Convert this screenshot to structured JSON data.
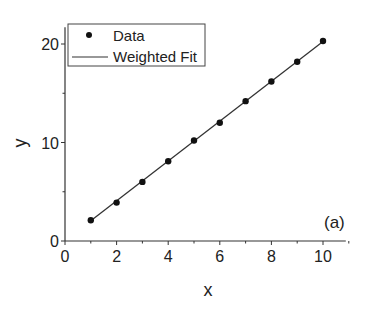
{
  "chart_data": {
    "type": "scatter",
    "title": "",
    "panel_label": "(a)",
    "xlabel": "x",
    "ylabel": "y",
    "xlim": [
      0,
      11
    ],
    "ylim": [
      0,
      22
    ],
    "xticks": [
      0,
      2,
      4,
      6,
      8,
      10
    ],
    "yticks": [
      0,
      10,
      20
    ],
    "y_minor_ticks": [
      5,
      15
    ],
    "x_minor_ticks": [
      1,
      3,
      5,
      7,
      9,
      11
    ],
    "grid": false,
    "legend_position": "upper-left",
    "series": [
      {
        "name": "Data",
        "type": "scatter",
        "marker": "filled-circle",
        "color": "#111111",
        "x": [
          1,
          2,
          3,
          4,
          5,
          6,
          7,
          8,
          9,
          10
        ],
        "y": [
          2.1,
          3.9,
          6.0,
          8.1,
          10.2,
          12.0,
          14.2,
          16.2,
          18.2,
          20.3
        ]
      },
      {
        "name": "Weighted Fit",
        "type": "line",
        "color": "#333333",
        "x": [
          1,
          10
        ],
        "y": [
          2.05,
          20.25
        ]
      }
    ]
  },
  "legend": {
    "items": [
      {
        "label": "Data",
        "symbol": "dot"
      },
      {
        "label": "Weighted Fit",
        "symbol": "line"
      }
    ]
  }
}
